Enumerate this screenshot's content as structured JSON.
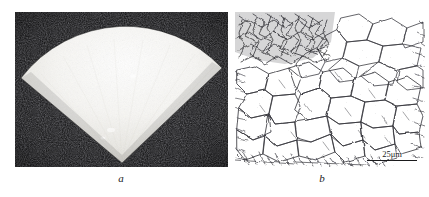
{
  "figure": {
    "background_color": "#ffffff",
    "panels": [
      {
        "id": "a",
        "caption": "a",
        "type": "micrograph",
        "description": "dark-field micrograph of a bright fan-shaped sector",
        "background_color": "#141414",
        "feature_color": "#f2f0ec"
      },
      {
        "id": "b",
        "caption": "b",
        "type": "micrograph",
        "description": "etched grain-boundary network micrograph",
        "background_color": "#ffffff",
        "feature_color": "#2c2c30",
        "scalebar": {
          "label": "25μm",
          "value": "25",
          "unit": "μm",
          "bar_color": "#1a1a1c"
        }
      }
    ]
  }
}
